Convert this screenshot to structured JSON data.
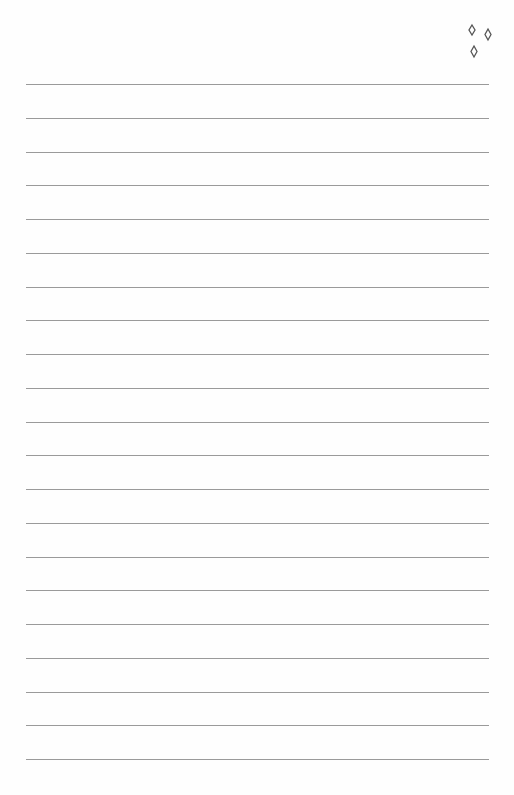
{
  "page": {
    "type": "lined-notebook-page",
    "background_color": "#fefefe",
    "line_color": "#9a9a9a",
    "line_count": 21,
    "first_line_y": 84,
    "line_spacing": 33.75,
    "line_left": 26,
    "line_width": 463
  },
  "decoration": {
    "icon": "sparkles-icon",
    "count": 3,
    "color": "#555555"
  }
}
